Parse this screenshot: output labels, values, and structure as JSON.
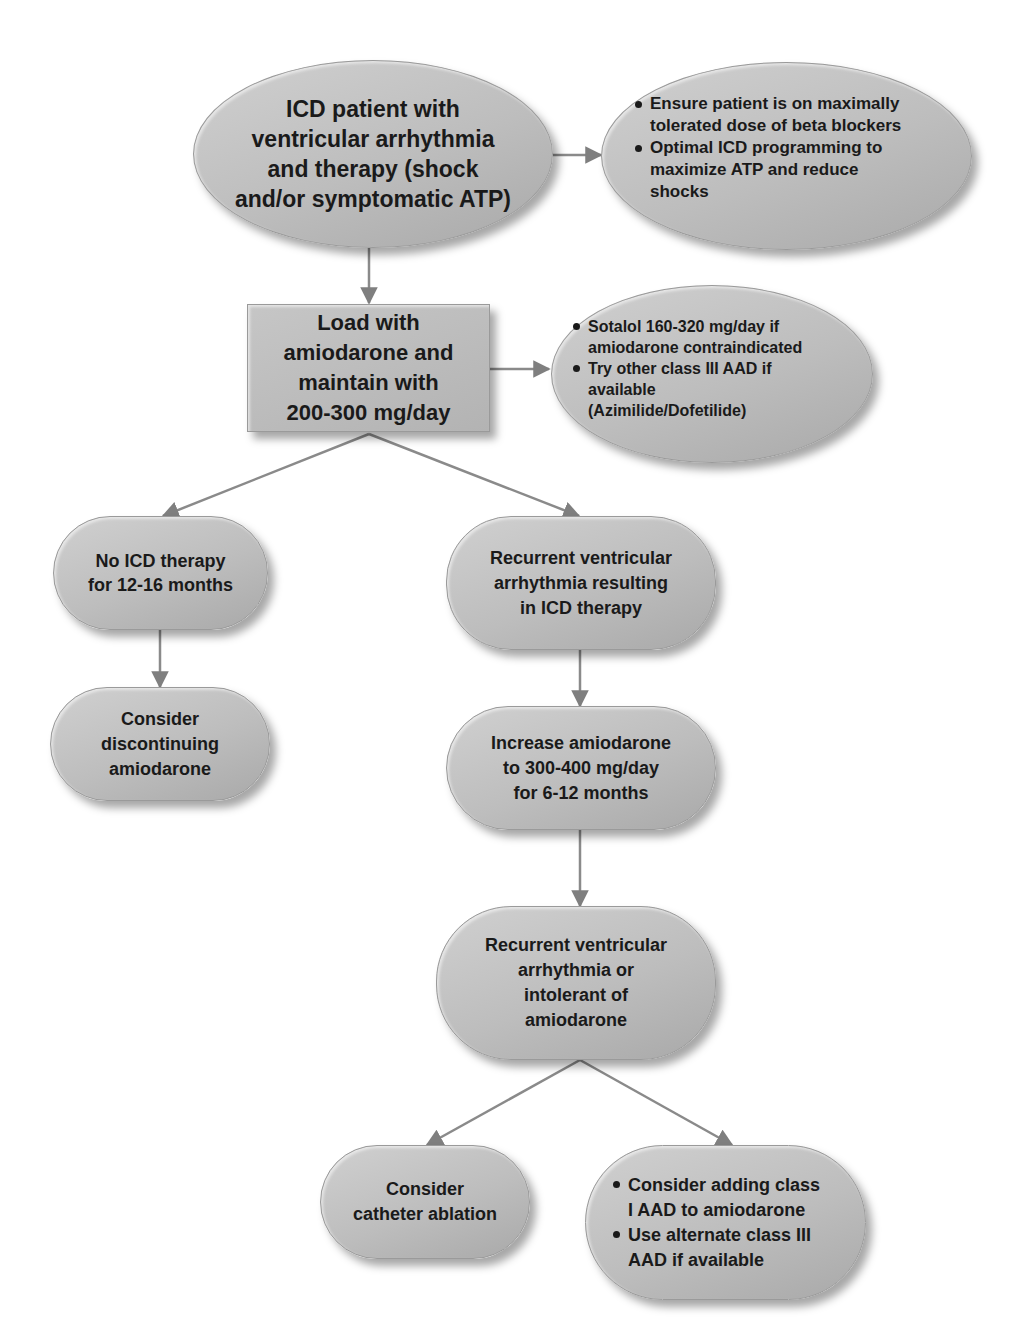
{
  "diagram": {
    "type": "flowchart",
    "colors": {
      "node_fill": "#bdbdbd",
      "connector": "#7f7f7f",
      "text": "#1a1a1a",
      "background": "#ffffff"
    },
    "nodes": {
      "start": {
        "text": "ICD patient with\nventricular arrhythmia\nand therapy (shock\nand/or symptomatic ATP)"
      },
      "start_side": {
        "bullets": [
          "Ensure patient is on maximally\ntolerated dose of beta blockers",
          "Optimal ICD programming to\nmaximize ATP and reduce\nshocks"
        ]
      },
      "load": {
        "text": "Load with\namiodarone and\nmaintain with\n200-300 mg/day"
      },
      "load_side": {
        "bullets": [
          "Sotalol 160-320 mg/day if\namiodarone contraindicated",
          "Try other class III AAD if\navailable\n(Azimilide/Dofetilide)"
        ]
      },
      "no_therapy": {
        "text": "No ICD therapy\nfor 12-16 months"
      },
      "discontinue": {
        "text": "Consider\ndiscontinuing\namiodarone"
      },
      "recurrent": {
        "text": "Recurrent ventricular\narrhythmia resulting\nin ICD therapy"
      },
      "increase": {
        "text": "Increase amiodarone\nto 300-400 mg/day\nfor 6-12 months"
      },
      "recurrent_intolerant": {
        "text": "Recurrent ventricular\narrhythmia or\nintolerant of\namiodarone"
      },
      "ablation": {
        "text": "Consider\ncatheter ablation"
      },
      "add_class": {
        "bullets": [
          "Consider adding class\nI AAD to amiodarone",
          "Use alternate class III\nAAD if available"
        ]
      }
    },
    "edges": [
      {
        "from": "start",
        "to": "start_side"
      },
      {
        "from": "start",
        "to": "load"
      },
      {
        "from": "load",
        "to": "load_side"
      },
      {
        "from": "load",
        "to": "no_therapy"
      },
      {
        "from": "load",
        "to": "recurrent"
      },
      {
        "from": "no_therapy",
        "to": "discontinue"
      },
      {
        "from": "recurrent",
        "to": "increase"
      },
      {
        "from": "increase",
        "to": "recurrent_intolerant"
      },
      {
        "from": "recurrent_intolerant",
        "to": "ablation"
      },
      {
        "from": "recurrent_intolerant",
        "to": "add_class"
      }
    ]
  }
}
